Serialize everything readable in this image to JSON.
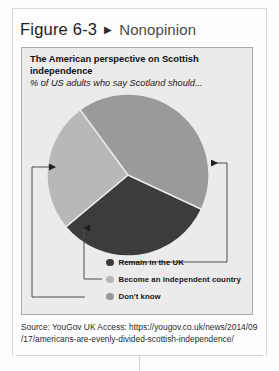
{
  "figure": {
    "number": "Figure 6-3",
    "arrow_icon": "triangle-right-icon",
    "arrow_glyph": "▶",
    "title": "Nonopinion"
  },
  "chart_card": {
    "title": "The American perspective on Scottish independence",
    "subtitle": "% of US adults who say Scotland should..."
  },
  "chart_data": {
    "type": "pie",
    "title": "The American perspective on Scottish independence",
    "subtitle": "% of US adults who say Scotland should...",
    "categories": [
      "Remain in the UK",
      "Become an independent country",
      "Don't know"
    ],
    "values": [
      32,
      26,
      42
    ],
    "colors": [
      "#3c3c3c",
      "#b8b8b8",
      "#9a9a9a"
    ],
    "legend_position": "bottom",
    "grid": false,
    "start_angle_deg": 25,
    "slice_angles_deg": [
      115,
      94,
      151
    ],
    "annotations": [
      {
        "target": "Remain in the UK",
        "direction": "arrow-left-into-pie"
      },
      {
        "target": "Don't know",
        "direction": "arrow-right-into-pie"
      },
      {
        "target": "Become an independent country",
        "direction": "arrow-up-into-pie"
      }
    ]
  },
  "legend": [
    {
      "label": "Remain in the UK",
      "color": "#3c3c3c"
    },
    {
      "label": "Become an independent country",
      "color": "#b8b8b8"
    },
    {
      "label": "Don't know",
      "color": "#9a9a9a"
    }
  ],
  "source": {
    "line1": "Source: YouGov UK Access: https://yougov.co.uk/news/2014/09",
    "line2": "/17/americans-are-evenly-divided-scottish-independence/"
  }
}
